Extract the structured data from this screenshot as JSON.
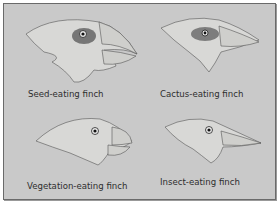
{
  "figure": {
    "background_color": "#c9c9c9",
    "border_color": "#6a6a6a",
    "panels": [
      {
        "label": "Seed-eating finch",
        "beak": "large-thick-crushing"
      },
      {
        "label": "Cactus-eating finch",
        "beak": "long-pointed"
      },
      {
        "label": "Vegetation-eating finch",
        "beak": "short-curved-parrot-like"
      },
      {
        "label": "Insect-eating finch",
        "beak": "slender-pointed"
      }
    ]
  }
}
